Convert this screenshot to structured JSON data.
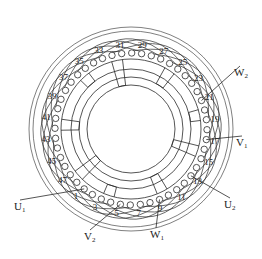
{
  "diagram": {
    "title": "",
    "type": "stator-winding-diagram",
    "total_slots": 48,
    "slot_labels": [
      "1",
      "3",
      "5",
      "7",
      "9",
      "11",
      "13",
      "15",
      "17",
      "19",
      "21",
      "23",
      "25",
      "27",
      "29",
      "31",
      "33",
      "35",
      "37",
      "39",
      "41",
      "43",
      "45",
      "47"
    ],
    "terminals": [
      {
        "id": "U1",
        "main": "U",
        "sub": "1",
        "slot": 1
      },
      {
        "id": "V2",
        "main": "V",
        "sub": "2",
        "slot": 5
      },
      {
        "id": "W1",
        "main": "W",
        "sub": "1",
        "slot": 9
      },
      {
        "id": "U2",
        "main": "U",
        "sub": "2",
        "slot": 13
      },
      {
        "id": "V1",
        "main": "V",
        "sub": "1",
        "slot": 17
      },
      {
        "id": "W2",
        "main": "W",
        "sub": "2",
        "slot": 21
      }
    ],
    "colors": {
      "line": "#2a2a2a",
      "background": "#ffffff"
    }
  }
}
